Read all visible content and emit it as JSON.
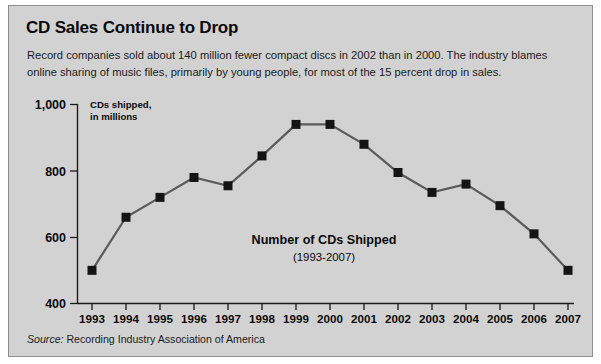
{
  "headline": "CD Sales Continue to Drop",
  "deck": "Record companies sold about 140 million fewer compact discs in 2002 than in 2000. The industry blames online sharing of music files, primarily by young people, for most of the 15 percent drop in sales.",
  "source": {
    "label": "Source:",
    "text": " Recording Industry Association of America"
  },
  "chart_data": {
    "type": "line",
    "title": "Number of CDs Shipped",
    "subtitle": "(1993-2007)",
    "xlabel": "",
    "ylabel": "CDs shipped, in millions",
    "ylabel_line1": "CDs shipped,",
    "ylabel_line2": "in millions",
    "categories": [
      "1993",
      "1994",
      "1995",
      "1996",
      "1997",
      "1998",
      "1999",
      "2000",
      "2001",
      "2002",
      "2003",
      "2004",
      "2005",
      "2006",
      "2007"
    ],
    "values": [
      500,
      660,
      720,
      780,
      755,
      845,
      940,
      940,
      880,
      795,
      735,
      760,
      695,
      610,
      500
    ],
    "ylim": [
      400,
      1000
    ],
    "yticks": [
      400,
      600,
      800,
      1000
    ],
    "ytick_labels": [
      "400",
      "600",
      "800",
      "1,000"
    ],
    "grid": false,
    "legend": false,
    "series_color": "#5a5a5a",
    "marker_color": "#141414",
    "marker": "square"
  },
  "colors": {
    "panel_background": "#d2d2d2",
    "panel_border": "#8d8d8d",
    "text": "#0a0a0a",
    "line": "#5a5a5a",
    "marker": "#141414"
  }
}
